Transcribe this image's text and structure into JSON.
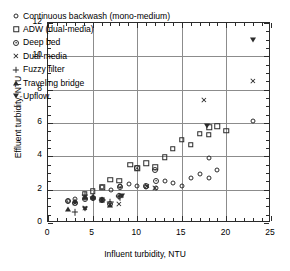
{
  "chart_data": {
    "type": "scatter",
    "title": "",
    "xlabel": "Influent turbidity, NTU",
    "ylabel": "Effluent turbidity, NTU",
    "xlim": [
      0,
      25
    ],
    "ylim": [
      0,
      12
    ],
    "xticks": [
      0,
      5,
      10,
      15,
      20,
      25
    ],
    "yticks": [
      0,
      2,
      4,
      6,
      8,
      10,
      12
    ],
    "xtick_labels": [
      "0",
      "5",
      "10",
      "15",
      "20",
      "25"
    ],
    "ytick_labels": [
      "0",
      "2",
      "4",
      "6",
      "8",
      "10",
      "12"
    ],
    "x_minor_interval": 1,
    "y_minor_interval": 0.5,
    "grid": true,
    "grid_axes": "both-major",
    "legend_position": "upper-left-inside",
    "marker_fill": "open",
    "marker_color": "#2b2b2b",
    "series": [
      {
        "name": "Continuous backwash (mono-medium)",
        "marker": "circle",
        "points": [
          [
            2.2,
            1.3
          ],
          [
            3.0,
            1.45
          ],
          [
            4.1,
            1.5
          ],
          [
            5.0,
            1.5
          ],
          [
            6.1,
            2.15
          ],
          [
            7.1,
            2.0
          ],
          [
            8.1,
            2.2
          ],
          [
            9.1,
            2.35
          ],
          [
            10.0,
            2.2
          ],
          [
            11.0,
            2.15
          ],
          [
            12.1,
            2.1
          ],
          [
            13.1,
            2.55
          ],
          [
            14.0,
            2.4
          ],
          [
            15.0,
            2.2
          ],
          [
            16.0,
            2.7
          ],
          [
            17.0,
            2.95
          ],
          [
            18.0,
            2.7
          ],
          [
            18.1,
            3.9
          ],
          [
            19.0,
            3.2
          ],
          [
            23.0,
            6.1
          ]
        ]
      },
      {
        "name": "ADW (dual-media)",
        "marker": "square",
        "points": [
          [
            4.1,
            1.75
          ],
          [
            5.0,
            1.9
          ],
          [
            6.1,
            2.15
          ],
          [
            7.0,
            2.6
          ],
          [
            8.0,
            2.55
          ],
          [
            9.2,
            3.5
          ],
          [
            10.0,
            3.3
          ],
          [
            11.0,
            3.6
          ],
          [
            12.0,
            3.35
          ],
          [
            13.1,
            3.95
          ],
          [
            14.0,
            4.45
          ],
          [
            15.0,
            5.0
          ],
          [
            16.0,
            4.7
          ],
          [
            17.0,
            5.35
          ],
          [
            18.0,
            5.3
          ],
          [
            18.1,
            5.75
          ],
          [
            19.0,
            5.8
          ],
          [
            20.0,
            5.55
          ]
        ]
      },
      {
        "name": "Deep bed",
        "marker": "circle-dot",
        "points": [
          [
            2.2,
            1.3
          ],
          [
            3.0,
            1.2
          ],
          [
            4.1,
            1.45
          ],
          [
            5.0,
            1.5
          ],
          [
            6.1,
            1.4
          ],
          [
            7.0,
            1.15
          ],
          [
            8.0,
            1.6
          ],
          [
            8.1,
            2.15
          ],
          [
            10.0,
            3.3
          ],
          [
            11.0,
            2.25
          ],
          [
            12.0,
            3.2
          ],
          [
            12.1,
            2.55
          ]
        ]
      },
      {
        "name": "Dual-media",
        "marker": "x",
        "points": [
          [
            3.0,
            1.2
          ],
          [
            4.1,
            0.9
          ],
          [
            7.0,
            1.1
          ],
          [
            8.0,
            1.15
          ],
          [
            11.1,
            2.25
          ],
          [
            12.0,
            2.1
          ],
          [
            17.5,
            7.4
          ],
          [
            23.0,
            8.5
          ]
        ]
      },
      {
        "name": "Fuzzy filter",
        "marker": "plus",
        "points": [
          [
            3.0,
            0.65
          ],
          [
            4.1,
            1.7
          ],
          [
            5.0,
            1.55
          ],
          [
            6.1,
            1.4
          ],
          [
            7.0,
            1.25
          ],
          [
            8.0,
            1.6
          ],
          [
            8.1,
            1.55
          ]
        ]
      },
      {
        "name": "Traveling bridge",
        "marker": "triangle-up",
        "points": [
          [
            2.2,
            0.85
          ],
          [
            3.0,
            1.35
          ],
          [
            4.1,
            1.55
          ],
          [
            5.0,
            1.55
          ],
          [
            6.1,
            1.4
          ],
          [
            7.0,
            1.1
          ]
        ]
      },
      {
        "name": "Upflow",
        "marker": "triangle-down",
        "points": [
          [
            4.1,
            0.85
          ],
          [
            6.1,
            1.4
          ],
          [
            8.3,
            1.6
          ],
          [
            17.8,
            5.8
          ],
          [
            23.0,
            11.0
          ]
        ]
      }
    ]
  },
  "legend": {
    "items": [
      {
        "label": "Continuous backwash (mono-medium)",
        "marker": "circle"
      },
      {
        "label": "ADW (dual-media)",
        "marker": "square"
      },
      {
        "label": "Deep bed",
        "marker": "circle-dot"
      },
      {
        "label": "Dual-media",
        "marker": "x"
      },
      {
        "label": "Fuzzy filter",
        "marker": "plus"
      },
      {
        "label": "Traveling bridge",
        "marker": "triangle-up"
      },
      {
        "label": "Upflow",
        "marker": "triangle-down"
      }
    ]
  }
}
